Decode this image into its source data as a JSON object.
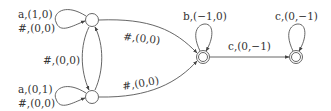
{
  "diagram": {
    "type": "automaton",
    "states": [
      {
        "id": "q0",
        "x": 92,
        "y": 20,
        "accepting": false
      },
      {
        "id": "q1",
        "x": 92,
        "y": 97,
        "accepting": false
      },
      {
        "id": "qb",
        "x": 203,
        "y": 57,
        "accepting": true
      },
      {
        "id": "qc",
        "x": 296,
        "y": 57,
        "accepting": true
      }
    ],
    "labels": {
      "q0_loop_a": "a,(1,0)",
      "q0_loop_hash": "#,(0,0)",
      "q1_loop_a": "a,(0,1)",
      "q1_loop_hash": "#,(0,0)",
      "q0_q1": "#,(0,0)",
      "q0_qb": "#,(0,0)",
      "q1_qb": "#,(0,0)",
      "qb_loop": "b,(−1,0)",
      "qb_qc": "c,(0,−1)",
      "qc_loop": "c,(0,−1)"
    }
  }
}
